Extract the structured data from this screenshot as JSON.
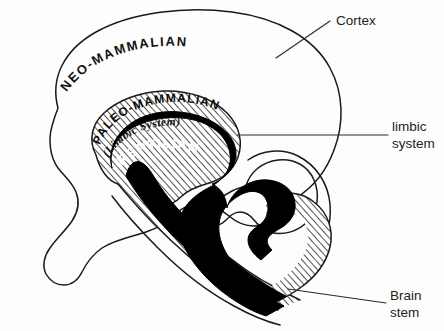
{
  "figure": {
    "background_color": "#fdfdfd",
    "ink_color": "#1a1a1a"
  },
  "regions": {
    "neocortex": {
      "label": "NEO-MAMMALIAN",
      "fill": "#ffffff",
      "label_color": "#141414"
    },
    "paleomammalian": {
      "label": "PALEO-MAMMALIAN",
      "sublabel": "(Limbic System)",
      "fill": "hatched",
      "label_color": "#0d0d0d"
    },
    "reptilian": {
      "label": "REPTILIAN",
      "fill": "#000000",
      "label_color": "#ffffff"
    }
  },
  "callouts": [
    {
      "id": "cortex",
      "label": "Cortex",
      "lines": [
        "Cortex"
      ]
    },
    {
      "id": "limbic-system",
      "label": "limbic system",
      "lines": [
        "limbic",
        "system"
      ]
    },
    {
      "id": "brain-stem",
      "label": "Brain stem",
      "lines": [
        "Brain",
        "stem"
      ]
    }
  ],
  "callout_text": {
    "cortex_line1": "Cortex",
    "limbic_line1": "limbic",
    "limbic_line2": "system",
    "brainstem_line1": "Brain",
    "brainstem_line2": "stem"
  },
  "region_text": {
    "neo": "NEO-MAMMALIAN",
    "paleo": "PALEO-MAMMALIAN",
    "limbic_paren": "(Limbic System)",
    "reptilian": "REPTILIAN"
  }
}
